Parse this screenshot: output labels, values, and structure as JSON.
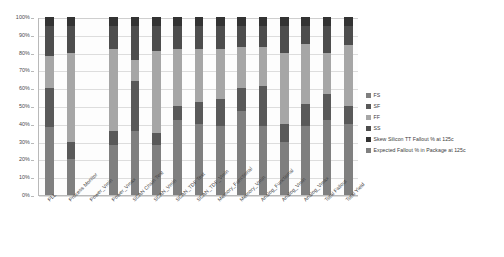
{
  "chart_data": {
    "type": "bar",
    "subtype": "100% stacked column",
    "title": "",
    "xlabel": "",
    "ylabel": "",
    "ylim": [
      0,
      100
    ],
    "ytick_labels": [
      "0%",
      "10%",
      "20%",
      "30%",
      "40%",
      "50%",
      "60%",
      "70%",
      "80%",
      "90%",
      "100%"
    ],
    "ytick_values": [
      0,
      10,
      20,
      30,
      40,
      50,
      60,
      70,
      80,
      90,
      100
    ],
    "grid": true,
    "legend_position": "right",
    "categories": [
      "PLL",
      "Process Monitor",
      "Power_Vmin",
      "Power_Vmax",
      "SCAN Chain Test",
      "SCAN_Vmin",
      "SCAN_TDF Test",
      "SCAN_TDF_Vmin",
      "Memory_Functional",
      "Memory_Vmin",
      "Analog_Functional",
      "Analog_Vmin",
      "Analog_Vmax",
      "Total Fallout",
      "Total Yield"
    ],
    "series": [
      {
        "name": "FS",
        "color": "#7f7f7f",
        "values": [
          38,
          20,
          0,
          28,
          36,
          28,
          42,
          40,
          39,
          47,
          39,
          30,
          39,
          42,
          40
        ]
      },
      {
        "name": "SF",
        "color": "#595959",
        "values": [
          22,
          10,
          0,
          8,
          28,
          7,
          8,
          12,
          15,
          13,
          22,
          10,
          12,
          15,
          10
        ]
      },
      {
        "name": "FF",
        "color": "#a6a6a6",
        "values": [
          18,
          50,
          0,
          46,
          12,
          46,
          32,
          30,
          28,
          23,
          22,
          40,
          34,
          23,
          34
        ]
      },
      {
        "name": "SS",
        "color": "#4d4d4d",
        "values": [
          17,
          15,
          0,
          13,
          19,
          14,
          13,
          13,
          13,
          12,
          12,
          15,
          10,
          15,
          11
        ]
      },
      {
        "name": "Skew Silicon TT Fallout % at 125c",
        "color": "#333333",
        "values": [
          5,
          5,
          0,
          5,
          5,
          5,
          5,
          5,
          5,
          5,
          5,
          5,
          5,
          5,
          5
        ]
      },
      {
        "name": "Expected Fallout % in Package at 125c",
        "color": "#808080",
        "values": [
          0,
          0,
          0,
          0,
          0,
          0,
          0,
          0,
          0,
          0,
          0,
          0,
          0,
          0,
          0
        ]
      }
    ]
  },
  "legend": {
    "items": [
      {
        "label": "FS",
        "color": "#7f7f7f"
      },
      {
        "label": "SF",
        "color": "#595959"
      },
      {
        "label": "FF",
        "color": "#a6a6a6"
      },
      {
        "label": "SS",
        "color": "#4d4d4d"
      },
      {
        "label": "Skew Silicon TT Fallout % at 125c",
        "color": "#333333"
      },
      {
        "label": "Expected Fallout % in Package at 125c",
        "color": "#808080"
      }
    ]
  },
  "colors": {
    "plot_background": "#fdfdfd",
    "gridline": "#dddddd",
    "axis": "#b9b9b9",
    "text": "#3a3a3a"
  }
}
